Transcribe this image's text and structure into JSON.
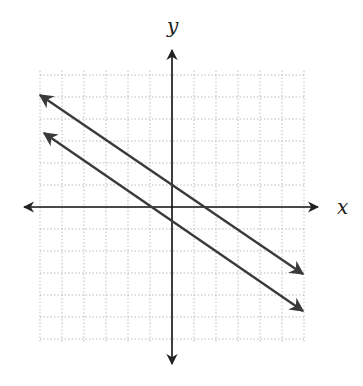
{
  "chart_data": {
    "type": "line",
    "title": "",
    "xlabel": "x",
    "ylabel": "y",
    "xlim": [
      -6,
      6
    ],
    "ylim": [
      -4,
      5
    ],
    "grid": true,
    "grid_style": "dotted",
    "tick_labels": false,
    "series": [
      {
        "name": "line-1",
        "equation": "y = -2/3 x + 1",
        "slope": -0.6667,
        "intercept": 1,
        "x": [
          -6,
          6
        ],
        "y": [
          5,
          -3
        ],
        "arrows": "both"
      },
      {
        "name": "line-2",
        "equation": "y = -2/3 x - 2/3",
        "slope": -0.6667,
        "intercept": -0.6667,
        "x": [
          -5.8,
          6
        ],
        "y": [
          3.2,
          -4.67
        ],
        "arrows": "both"
      }
    ],
    "annotations": [
      "parallel lines"
    ]
  },
  "axes": {
    "x_label": "x",
    "y_label": "y"
  },
  "colors": {
    "lines": "#333333",
    "grid": "#b0b0b0",
    "axes": "#111111"
  }
}
